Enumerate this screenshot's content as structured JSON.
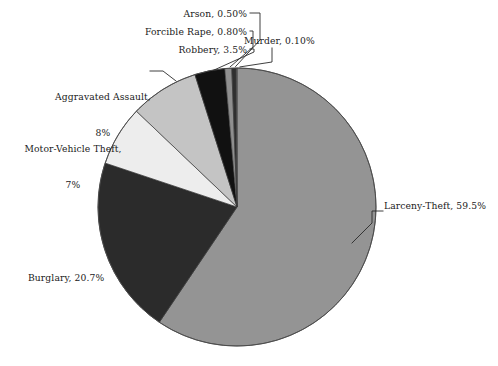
{
  "chart_data": {
    "type": "pie",
    "title": "",
    "subtitle": "",
    "xlabel": "",
    "ylabel": "",
    "legend_position": "none",
    "grid": false,
    "start_angle_deg": 0,
    "direction": "clockwise",
    "categories": [
      "Larceny-Theft",
      "Burglary",
      "Motor-Vehicle Theft",
      "Aggravated Assault",
      "Robbery",
      "Forcible Rape",
      "Arson",
      "Murder"
    ],
    "values": [
      59.5,
      20.7,
      7,
      8,
      3.5,
      0.8,
      0.5,
      0.1
    ],
    "unit": "%",
    "slices": [
      {
        "name": "Larceny-Theft",
        "value": 59.5,
        "label": "Larceny-Theft, 59.5%",
        "color": "#949494"
      },
      {
        "name": "Burglary",
        "value": 20.7,
        "label": "Burglary, 20.7%",
        "color": "#2b2b2b"
      },
      {
        "name": "Motor-Vehicle Theft",
        "value": 7,
        "label": "Motor-Vehicle Theft,\n7%",
        "color": "#ededed"
      },
      {
        "name": "Aggravated Assault",
        "value": 8,
        "label": "Aggravated Assault,\n8%",
        "color": "#c4c4c4"
      },
      {
        "name": "Robbery",
        "value": 3.5,
        "label": "Robbery, 3.5%",
        "color": "#111111"
      },
      {
        "name": "Forcible Rape",
        "value": 0.8,
        "label": "Forcible Rape, 0.80%",
        "color": "#8f8f8f"
      },
      {
        "name": "Arson",
        "value": 0.5,
        "label": "Arson, 0.50%",
        "color": "#2f2f2f"
      },
      {
        "name": "Murder",
        "value": 0.1,
        "label": "Murder, 0.10%",
        "color": "#6e6e6e"
      }
    ]
  },
  "labels": {
    "arson": "Arson, 0.50%",
    "forcible_rape": "Forcible Rape, 0.80%",
    "robbery": "Robbery, 3.5%",
    "murder": "Murder, 0.10%",
    "aggravated_assault_line1": "Aggravated Assault,",
    "aggravated_assault_line2": "8%",
    "motor_vehicle_theft_line1": "Motor-Vehicle Theft,",
    "motor_vehicle_theft_line2": "7%",
    "burglary": "Burglary, 20.7%",
    "larceny_theft": "Larceny-Theft, 59.5%"
  },
  "colors": {
    "background": "#ffffff",
    "text": "#1a1a1a",
    "leader_line": "#2a2a2a",
    "slice_outline": "#3a3a3a"
  }
}
